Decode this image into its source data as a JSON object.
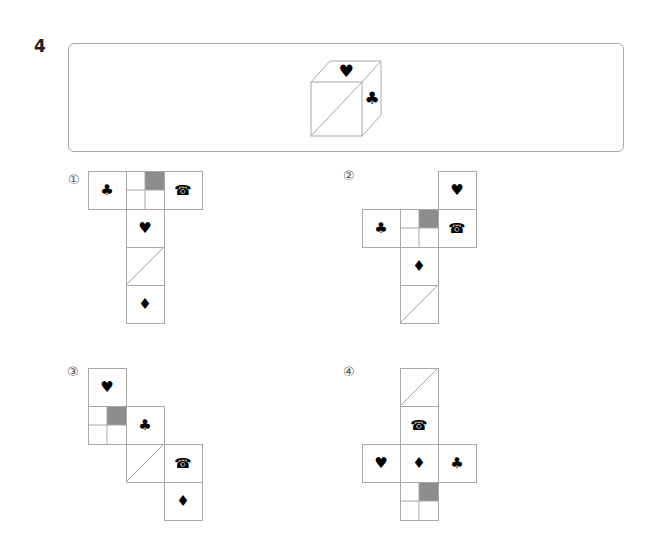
{
  "question": {
    "number": "4"
  },
  "cube": {
    "top_face": "♥",
    "right_face": "♣",
    "front_face": "diagonal"
  },
  "colors": {
    "line": "#a8a8a8",
    "shade": "#8c8c8c",
    "symbol": "#000000"
  },
  "options": [
    {
      "label": "①",
      "faces": [
        {
          "x": 88,
          "y": 171,
          "type": "symbol",
          "symbol": "♣"
        },
        {
          "x": 126,
          "y": 171,
          "type": "grid"
        },
        {
          "x": 164,
          "y": 171,
          "type": "symbol",
          "symbol": "☎"
        },
        {
          "x": 126,
          "y": 209,
          "type": "symbol",
          "symbol": "♥"
        },
        {
          "x": 126,
          "y": 247,
          "type": "diagonal"
        },
        {
          "x": 126,
          "y": 285,
          "type": "symbol",
          "symbol": "♦"
        }
      ]
    },
    {
      "label": "②",
      "faces": [
        {
          "x": 438,
          "y": 171,
          "type": "symbol",
          "symbol": "♥"
        },
        {
          "x": 362,
          "y": 209,
          "type": "symbol",
          "symbol": "♣"
        },
        {
          "x": 400,
          "y": 209,
          "type": "grid"
        },
        {
          "x": 438,
          "y": 209,
          "type": "symbol",
          "symbol": "☎"
        },
        {
          "x": 400,
          "y": 247,
          "type": "symbol",
          "symbol": "♦"
        },
        {
          "x": 400,
          "y": 285,
          "type": "diagonal"
        }
      ]
    },
    {
      "label": "③",
      "faces": [
        {
          "x": 88,
          "y": 368,
          "type": "symbol",
          "symbol": "♥"
        },
        {
          "x": 88,
          "y": 406,
          "type": "grid"
        },
        {
          "x": 126,
          "y": 406,
          "type": "symbol",
          "symbol": "♣"
        },
        {
          "x": 126,
          "y": 444,
          "type": "diagonal"
        },
        {
          "x": 164,
          "y": 444,
          "type": "symbol",
          "symbol": "☎"
        },
        {
          "x": 164,
          "y": 482,
          "type": "symbol",
          "symbol": "♦"
        }
      ]
    },
    {
      "label": "④",
      "faces": [
        {
          "x": 400,
          "y": 368,
          "type": "diagonal"
        },
        {
          "x": 400,
          "y": 406,
          "type": "symbol",
          "symbol": "☎"
        },
        {
          "x": 362,
          "y": 444,
          "type": "symbol",
          "symbol": "♥"
        },
        {
          "x": 400,
          "y": 444,
          "type": "symbol",
          "symbol": "♦"
        },
        {
          "x": 438,
          "y": 444,
          "type": "symbol",
          "symbol": "♣"
        },
        {
          "x": 400,
          "y": 482,
          "type": "grid"
        }
      ]
    }
  ]
}
